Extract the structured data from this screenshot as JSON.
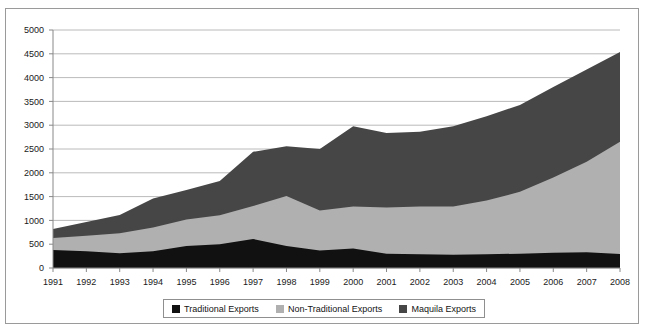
{
  "figure": {
    "background_color": "#ffffff",
    "frame_color": "#9a9a9a"
  },
  "chart_data": {
    "type": "area",
    "stacked": true,
    "title": "",
    "subtitle": "",
    "xlabel": "",
    "ylabel": "",
    "grid": true,
    "grid_axis": "y",
    "legend_position": "bottom",
    "xlim": [
      1991,
      2008
    ],
    "ylim": [
      0,
      5000
    ],
    "ytick_step": 500,
    "categories": [
      1991,
      1992,
      1993,
      1994,
      1995,
      1996,
      1997,
      1998,
      1999,
      2000,
      2001,
      2002,
      2003,
      2004,
      2005,
      2006,
      2007,
      2008
    ],
    "xtick_labels": [
      "1991",
      "1992",
      "1993",
      "1994",
      "1995",
      "1996",
      "1997",
      "1998",
      "1999",
      "2000",
      "2001",
      "2002",
      "2003",
      "2004",
      "2005",
      "2006",
      "2007",
      "2008"
    ],
    "ytick_labels": [
      "0",
      "500",
      "1000",
      "1500",
      "2000",
      "2500",
      "3000",
      "3500",
      "4000",
      "4500",
      "5000"
    ],
    "ytick_values": [
      0,
      500,
      1000,
      1500,
      2000,
      2500,
      3000,
      3500,
      4000,
      4500,
      5000
    ],
    "series": [
      {
        "name": "Traditional Exports",
        "color": "#111111",
        "values": [
          378,
          350,
          310,
          350,
          460,
          500,
          610,
          460,
          370,
          410,
          300,
          290,
          280,
          290,
          300,
          320,
          330,
          295
        ]
      },
      {
        "name": "Non-Traditional Exports",
        "color": "#b0b0b0",
        "values": [
          252,
          330,
          420,
          500,
          560,
          610,
          690,
          1050,
          840,
          880,
          970,
          1000,
          1010,
          1130,
          1300,
          1580,
          1900,
          2355
        ]
      },
      {
        "name": "Maquila Exports",
        "color": "#464646",
        "values": [
          190,
          285,
          385,
          610,
          620,
          720,
          1140,
          1050,
          1290,
          1690,
          1565,
          1570,
          1690,
          1770,
          1825,
          1900,
          1940,
          1890
        ]
      }
    ],
    "stack_totals": [
      820,
      965,
      1115,
      1460,
      1640,
      1830,
      2440,
      2560,
      2500,
      2980,
      2835,
      2860,
      2980,
      3190,
      3425,
      3800,
      4170,
      4540
    ],
    "legend": [
      {
        "label": "Traditional Exports",
        "color": "#111111"
      },
      {
        "label": "Non-Traditional Exports",
        "color": "#b0b0b0"
      },
      {
        "label": "Maquila Exports",
        "color": "#464646"
      }
    ]
  }
}
